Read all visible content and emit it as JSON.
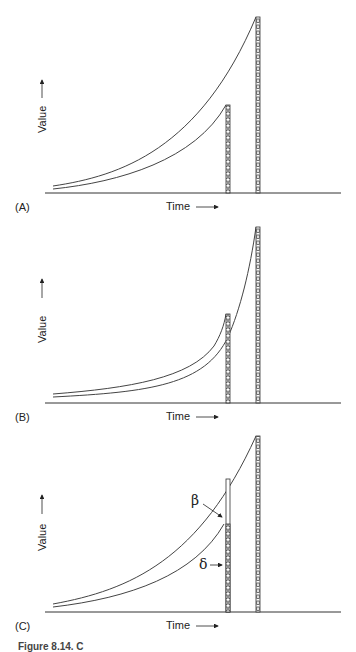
{
  "figure": {
    "caption": "Figure 8.14. C",
    "panels": [
      {
        "id": "A",
        "panel_label": "(A)",
        "x_axis_label": "Time",
        "y_axis_label": "Value",
        "bars": [
          {
            "name": "short-bar",
            "relative_height": 0.5,
            "style": "hatched"
          },
          {
            "name": "tall-bar",
            "relative_height": 1.0,
            "style": "hatched"
          }
        ],
        "curves": [
          "lower exponential curve ending at short bar",
          "upper exponential curve ending at tall bar"
        ]
      },
      {
        "id": "B",
        "panel_label": "(B)",
        "x_axis_label": "Time",
        "y_axis_label": "Value",
        "bars": [
          {
            "name": "short-bar",
            "relative_height": 0.5,
            "style": "hatched"
          },
          {
            "name": "tall-bar",
            "relative_height": 1.0,
            "style": "hatched"
          }
        ],
        "curves": [
          "hyperbolic curve ending at short bar",
          "hyperbolic curve ending at tall bar (curves cross)"
        ]
      },
      {
        "id": "C",
        "panel_label": "(C)",
        "x_axis_label": "Time",
        "y_axis_label": "Value",
        "bars": [
          {
            "name": "short-bar",
            "relative_height": 0.75,
            "style": "partially hatched"
          },
          {
            "name": "tall-bar",
            "relative_height": 1.0,
            "style": "hatched"
          }
        ],
        "annotations": [
          {
            "symbol": "β",
            "points_to": "gap at top of short bar"
          },
          {
            "symbol": "δ",
            "points_to": "hatched portion of short bar"
          }
        ]
      }
    ]
  }
}
